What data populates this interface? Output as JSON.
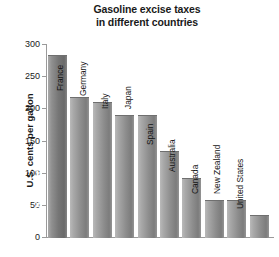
{
  "chart_data": {
    "type": "bar",
    "title": "Gasoline excise taxes in different countries",
    "title_lines": [
      "Gasoline excise taxes",
      "in different countries"
    ],
    "xlabel": "",
    "ylabel": "U.S. cents per gallon",
    "ylim": [
      0,
      300
    ],
    "ytick_values": [
      300,
      250,
      200,
      150,
      100,
      50,
      0
    ],
    "ytick_labels": [
      "300",
      "250",
      "200",
      "150",
      "100",
      "50",
      "0"
    ],
    "grid": false,
    "legend": null,
    "categories": [
      "United Kingdom",
      "France",
      "Germany",
      "Italy",
      "Japan",
      "Spain",
      "Australia",
      "Canada",
      "New Zealand",
      "United States"
    ],
    "values": [
      285,
      219,
      211,
      191,
      191,
      136,
      94,
      59,
      59,
      35
    ],
    "bars": [
      {
        "label": "United Kingdom",
        "value": 285,
        "label_inside": true
      },
      {
        "label": "France",
        "value": 219,
        "label_inside": false
      },
      {
        "label": "Germany",
        "value": 211,
        "label_inside": false
      },
      {
        "label": "Italy",
        "value": 191,
        "label_inside": false
      },
      {
        "label": "Japan",
        "value": 191,
        "label_inside": false
      },
      {
        "label": "Spain",
        "value": 136,
        "label_inside": false
      },
      {
        "label": "Australia",
        "value": 94,
        "label_inside": false
      },
      {
        "label": "Canada",
        "value": 59,
        "label_inside": false
      },
      {
        "label": "New Zealand",
        "value": 59,
        "label_inside": false
      },
      {
        "label": "United States",
        "value": 35,
        "label_inside": false
      }
    ],
    "colors": {
      "bar_fill": "#8e8e8e",
      "bar_fill_highlight": "#767676",
      "axis": "#9a9a9a",
      "text": "#1a1a1a",
      "background": "#ffffff"
    }
  }
}
